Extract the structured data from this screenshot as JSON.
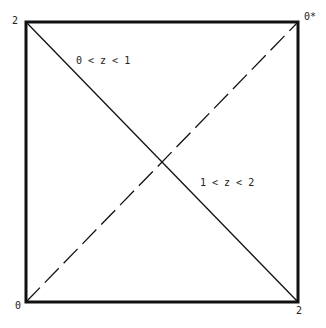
{
  "diagram": {
    "corner_labels": {
      "top_left": "2",
      "top_right": "0*",
      "bottom_left": "0",
      "bottom_right": "2"
    },
    "region_labels": {
      "upper": "0 < z < 1",
      "lower": "1 < z < 2"
    },
    "colors": {
      "stroke": "#111111",
      "background": "#ffffff"
    }
  }
}
